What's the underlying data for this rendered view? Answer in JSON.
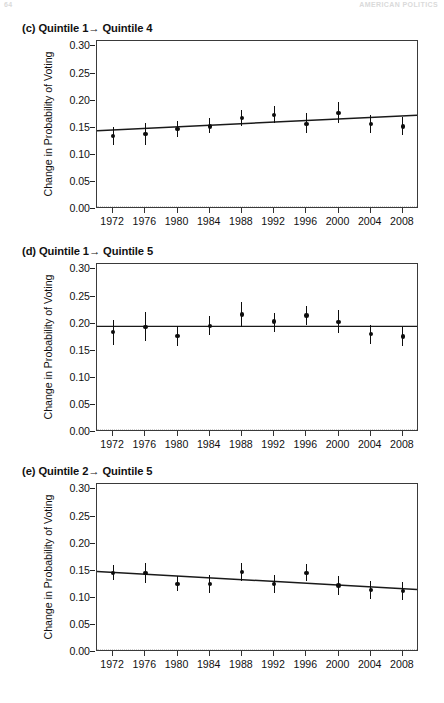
{
  "page_header": {
    "left": "64",
    "right": "AMERICAN POLITICS"
  },
  "axis": {
    "ylabel": "Change in Probability of Voting",
    "yticks": [
      "0.30",
      "0.25",
      "0.20",
      "0.15",
      "0.10",
      "0.05",
      "0.00"
    ],
    "ytick_values": [
      0.3,
      0.25,
      0.2,
      0.15,
      0.1,
      0.05,
      0.0
    ],
    "ylim": [
      0.0,
      0.31
    ],
    "xticks": [
      "1972",
      "1976",
      "1980",
      "1984",
      "1988",
      "1992",
      "1996",
      "2000",
      "2004",
      "2008"
    ]
  },
  "chart_data": [
    {
      "id": "panel-c",
      "type": "scatter",
      "title": "(c) Quintile 1→ Quintile 4",
      "panel_letter": "(c)",
      "label_from": "Quintile 1",
      "label_to": "Quintile 4",
      "xlabel": "",
      "ylabel": "Change in Probability of Voting",
      "ylim": [
        0.0,
        0.31
      ],
      "yticks": [
        0.0,
        0.05,
        0.1,
        0.15,
        0.2,
        0.25,
        0.3
      ],
      "grid": false,
      "legend": "none",
      "categories": [
        1972,
        1976,
        1980,
        1984,
        1988,
        1992,
        1996,
        2000,
        2004,
        2008
      ],
      "values": [
        0.135,
        0.138,
        0.148,
        0.152,
        0.168,
        0.173,
        0.157,
        0.177,
        0.157,
        0.152
      ],
      "err_low": [
        0.118,
        0.118,
        0.133,
        0.14,
        0.154,
        0.159,
        0.14,
        0.158,
        0.141,
        0.137
      ],
      "err_high": [
        0.152,
        0.158,
        0.163,
        0.167,
        0.183,
        0.19,
        0.177,
        0.198,
        0.173,
        0.17
      ],
      "trendline": {
        "y_start": 0.1425,
        "y_end": 0.1715,
        "style": "solid"
      },
      "zero_reference": {
        "value": 0.0,
        "style": "dotted"
      }
    },
    {
      "id": "panel-d",
      "type": "scatter",
      "title": "(d) Quintile 1→ Quintile 5",
      "panel_letter": "(d)",
      "label_from": "Quintile 1",
      "label_to": "Quintile 5",
      "xlabel": "",
      "ylabel": "Change in Probability of Voting",
      "ylim": [
        0.0,
        0.31
      ],
      "yticks": [
        0.0,
        0.05,
        0.1,
        0.15,
        0.2,
        0.25,
        0.3
      ],
      "grid": false,
      "legend": "none",
      "categories": [
        1972,
        1976,
        1980,
        1984,
        1988,
        1992,
        1996,
        2000,
        2004,
        2008
      ],
      "values": [
        0.184,
        0.194,
        0.177,
        0.196,
        0.217,
        0.204,
        0.215,
        0.203,
        0.181,
        0.176
      ],
      "err_low": [
        0.161,
        0.167,
        0.158,
        0.179,
        0.194,
        0.185,
        0.197,
        0.182,
        0.163,
        0.158
      ],
      "err_high": [
        0.206,
        0.222,
        0.196,
        0.214,
        0.24,
        0.219,
        0.233,
        0.225,
        0.198,
        0.194
      ],
      "trendline": {
        "y_start": 0.1935,
        "y_end": 0.1935,
        "style": "solid"
      },
      "zero_reference": {
        "value": 0.0,
        "style": "dotted"
      }
    },
    {
      "id": "panel-e",
      "type": "scatter",
      "title": "(e) Quintile 2→ Quintile 5",
      "panel_letter": "(e)",
      "label_from": "Quintile 2",
      "label_to": "Quintile 5",
      "xlabel": "",
      "ylabel": "Change in Probability of Voting",
      "ylim": [
        0.0,
        0.31
      ],
      "yticks": [
        0.0,
        0.05,
        0.1,
        0.15,
        0.2,
        0.25,
        0.3
      ],
      "grid": false,
      "legend": "none",
      "categories": [
        1972,
        1976,
        1980,
        1984,
        1988,
        1992,
        1996,
        2000,
        2004,
        2008
      ],
      "values": [
        0.146,
        0.146,
        0.126,
        0.125,
        0.148,
        0.126,
        0.146,
        0.123,
        0.114,
        0.113
      ],
      "err_low": [
        0.132,
        0.127,
        0.112,
        0.109,
        0.131,
        0.108,
        0.131,
        0.105,
        0.097,
        0.096
      ],
      "err_high": [
        0.16,
        0.164,
        0.14,
        0.142,
        0.165,
        0.143,
        0.162,
        0.141,
        0.131,
        0.13
      ],
      "trendline": {
        "y_start": 0.1465,
        "y_end": 0.113,
        "style": "solid"
      },
      "zero_reference": {
        "value": 0.0,
        "style": "dotted"
      }
    }
  ]
}
